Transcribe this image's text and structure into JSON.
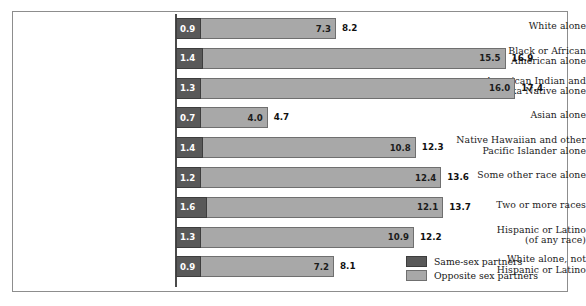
{
  "chart_data": {
    "type": "bar",
    "orientation": "horizontal",
    "stacked": true,
    "title": "",
    "subtitle": "",
    "xlabel": "",
    "ylabel": "",
    "grid": false,
    "legend_position": "bottom-right",
    "xlim": [
      0,
      17.4
    ],
    "categories": [
      "White alone",
      "Black or African American alone",
      "American Indian and Alaska Native alone",
      "Asian alone",
      "Native Hawaiian and other Pacific Islander alone",
      "Some other race alone",
      "Two or more races",
      "Hispanic or Latino (of any race)",
      "White alone, not Hispanic or Latino"
    ],
    "series": [
      {
        "name": "Same-sex partners",
        "color": "#595959",
        "values": [
          0.9,
          1.4,
          1.3,
          0.7,
          1.4,
          1.2,
          1.6,
          1.3,
          0.9
        ]
      },
      {
        "name": "Opposite sex partners",
        "color": "#a8a8a8",
        "values": [
          7.3,
          15.5,
          16.0,
          4.0,
          10.8,
          12.4,
          12.1,
          10.9,
          7.2
        ]
      }
    ],
    "totals": [
      8.2,
      16.9,
      17.4,
      4.7,
      12.3,
      13.6,
      13.7,
      12.2,
      8.1
    ]
  },
  "rows": [
    {
      "label_lines": [
        "White alone"
      ],
      "dark_value": "0.9",
      "light_value": "7.3",
      "total_value": "8.2",
      "dark_num": 0.9,
      "light_num": 7.3,
      "total_num": 8.2
    },
    {
      "label_lines": [
        "Black or African",
        "American alone"
      ],
      "dark_value": "1.4",
      "light_value": "15.5",
      "total_value": "16.9",
      "dark_num": 1.4,
      "light_num": 15.5,
      "total_num": 16.9
    },
    {
      "label_lines": [
        "American Indian and",
        "Alaska Native alone"
      ],
      "dark_value": "1.3",
      "light_value": "16.0",
      "total_value": "17.4",
      "dark_num": 1.3,
      "light_num": 16.0,
      "total_num": 17.4
    },
    {
      "label_lines": [
        "Asian alone"
      ],
      "dark_value": "0.7",
      "light_value": "4.0",
      "total_value": "4.7",
      "dark_num": 0.7,
      "light_num": 4.0,
      "total_num": 4.7
    },
    {
      "label_lines": [
        "Native Hawaiian and other",
        "Pacific Islander alone"
      ],
      "dark_value": "1.4",
      "light_value": "10.8",
      "total_value": "12.3",
      "dark_num": 1.4,
      "light_num": 10.8,
      "total_num": 12.3
    },
    {
      "label_lines": [
        "Some other race alone"
      ],
      "dark_value": "1.2",
      "light_value": "12.4",
      "total_value": "13.6",
      "dark_num": 1.2,
      "light_num": 12.4,
      "total_num": 13.6
    },
    {
      "label_lines": [
        "Two or more races"
      ],
      "dark_value": "1.6",
      "light_value": "12.1",
      "total_value": "13.7",
      "dark_num": 1.6,
      "light_num": 12.1,
      "total_num": 13.7
    },
    {
      "label_lines": [
        "Hispanic or Latino",
        "(of any race)"
      ],
      "dark_value": "1.3",
      "light_value": "10.9",
      "total_value": "12.2",
      "dark_num": 1.3,
      "light_num": 10.9,
      "total_num": 12.2
    },
    {
      "label_lines": [
        "White alone, not",
        "Hispanic or Latino"
      ],
      "dark_value": "0.9",
      "light_value": "7.2",
      "total_value": "8.1",
      "dark_num": 0.9,
      "light_num": 7.2,
      "total_num": 8.1
    }
  ],
  "legend": {
    "items": [
      {
        "label": "Same-sex partners",
        "swatch": "dark",
        "color": "#595959"
      },
      {
        "label": "Opposite sex partners",
        "swatch": "light",
        "color": "#a8a8a8"
      }
    ]
  },
  "layout": {
    "axis_x": 176,
    "px_per_unit": 19.5,
    "row_top_first": 16,
    "row_pitch": 29.8,
    "min_dark_px": 25
  }
}
